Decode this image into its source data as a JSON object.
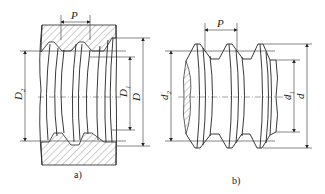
{
  "figure_a": {
    "caption": "a)",
    "pitch_label": "P",
    "labels": {
      "pitch_diameter": "D2",
      "minor_diameter": "D1",
      "major_diameter": "D"
    },
    "label_main": {
      "pitch": "D",
      "minor": "D",
      "major": "D"
    },
    "label_sub": {
      "pitch": "2",
      "minor": "1"
    },
    "description": "Internal thread (nut) section"
  },
  "figure_b": {
    "caption": "b)",
    "pitch_label": "P",
    "labels": {
      "pitch_diameter": "d2",
      "minor_diameter": "d1",
      "major_diameter": "d"
    },
    "label_main": {
      "pitch": "d",
      "minor": "d",
      "major": "d"
    },
    "label_sub": {
      "pitch": "2",
      "minor": "1"
    },
    "description": "External thread (bolt)"
  }
}
